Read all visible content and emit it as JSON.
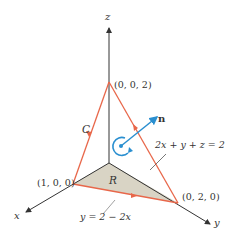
{
  "diagram": {
    "title": "",
    "axes": {
      "x_label": "x",
      "y_label": "y",
      "z_label": "z"
    },
    "points": {
      "z_intercept": "(0, 0, 2)",
      "x_intercept": "(1, 0, 0)",
      "y_intercept": "(0, 2, 0)"
    },
    "curve_label": "C",
    "region_label": "R",
    "normal_label": "n",
    "plane_equation": "2x + y + z = 2",
    "line_equation": "y = 2 − 2x",
    "colors": {
      "curve": "#e8674a",
      "normal": "#2a8fd0",
      "region_fill": "#d9d4c5",
      "axes": "#333333"
    }
  }
}
